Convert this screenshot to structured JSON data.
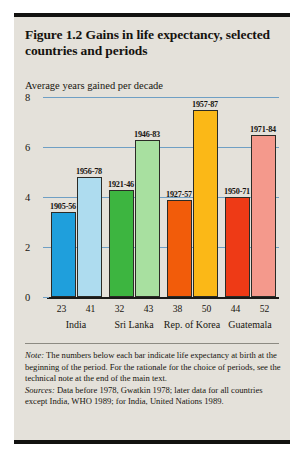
{
  "figure": {
    "title": "Figure 1.2  Gains in life expectancy, selected countries and periods",
    "axis_caption": "Average years gained per decade",
    "note_label": "Note:",
    "note_text": " The numbers below each bar indicate life expectancy at birth at the beginning of the period. For the rationale for the choice of periods, see the technical note at the end of the main text.",
    "sources_label": "Sources:",
    "sources_text": " Data before 1978, Gwatkin 1978; later data for all countries except India, WHO 1989; for India, United Nations 1989."
  },
  "colors": {
    "panel_background": "#e4e1da",
    "gridline": "#6f9fc4",
    "axis": "#1a1a18",
    "rule": "#121210",
    "india_first": "#1f9fdc",
    "india_second": "#aedcef",
    "sri_lanka_first": "#3db540",
    "sri_lanka_second": "#a8e0a0",
    "korea_first": "#f25c0a",
    "korea_second": "#fbb817",
    "guatemala_first": "#ee3a16",
    "guatemala_second": "#f4998c"
  },
  "chart_data": {
    "type": "bar",
    "title": "Figure 1.2  Gains in life expectancy, selected countries and periods",
    "xlabel": "",
    "ylabel": "Average years gained per decade",
    "ylim": [
      0,
      8
    ],
    "yticks": [
      0,
      2,
      4,
      6,
      8
    ],
    "ytick_labels": [
      "0",
      "2",
      "4",
      "6",
      "8"
    ],
    "grid": true,
    "legend": "none",
    "categories": [
      "India",
      "Sri Lanka",
      "Rep. of Korea",
      "Guatemala"
    ],
    "bars": [
      {
        "country": "India",
        "period": "1905-56",
        "value": 3.4,
        "life_expectancy_at_start": "23",
        "color": "#1f9fdc"
      },
      {
        "country": "India",
        "period": "1956-78",
        "value": 4.8,
        "life_expectancy_at_start": "41",
        "color": "#aedcef"
      },
      {
        "country": "Sri Lanka",
        "period": "1921-46",
        "value": 4.3,
        "life_expectancy_at_start": "32",
        "color": "#3db540"
      },
      {
        "country": "Sri Lanka",
        "period": "1946-83",
        "value": 6.3,
        "life_expectancy_at_start": "43",
        "color": "#a8e0a0"
      },
      {
        "country": "Rep. of Korea",
        "period": "1927-57",
        "value": 3.9,
        "life_expectancy_at_start": "38",
        "color": "#f25c0a"
      },
      {
        "country": "Rep. of Korea",
        "period": "1957-87",
        "value": 7.5,
        "life_expectancy_at_start": "50",
        "color": "#fbb817"
      },
      {
        "country": "Guatemala",
        "period": "1950-71",
        "value": 4.0,
        "life_expectancy_at_start": "44",
        "color": "#ee3a16"
      },
      {
        "country": "Guatemala",
        "period": "1971-84",
        "value": 6.5,
        "life_expectancy_at_start": "52",
        "color": "#f4998c"
      }
    ]
  }
}
